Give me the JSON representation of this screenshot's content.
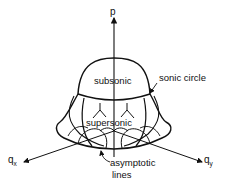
{
  "diagram": {
    "axes": {
      "vertical": "p",
      "left": {
        "base": "q",
        "sub": "x"
      },
      "right": {
        "base": "q",
        "sub": "y"
      }
    },
    "regions": {
      "upper": "subsonic",
      "lower": "supersonic"
    },
    "annotations": {
      "sonic_circle": "sonic circle",
      "asymptotic_line1": "asymptotic",
      "asymptotic_line2": "lines"
    },
    "colors": {
      "ink": "#111111",
      "background": "#ffffff"
    }
  }
}
